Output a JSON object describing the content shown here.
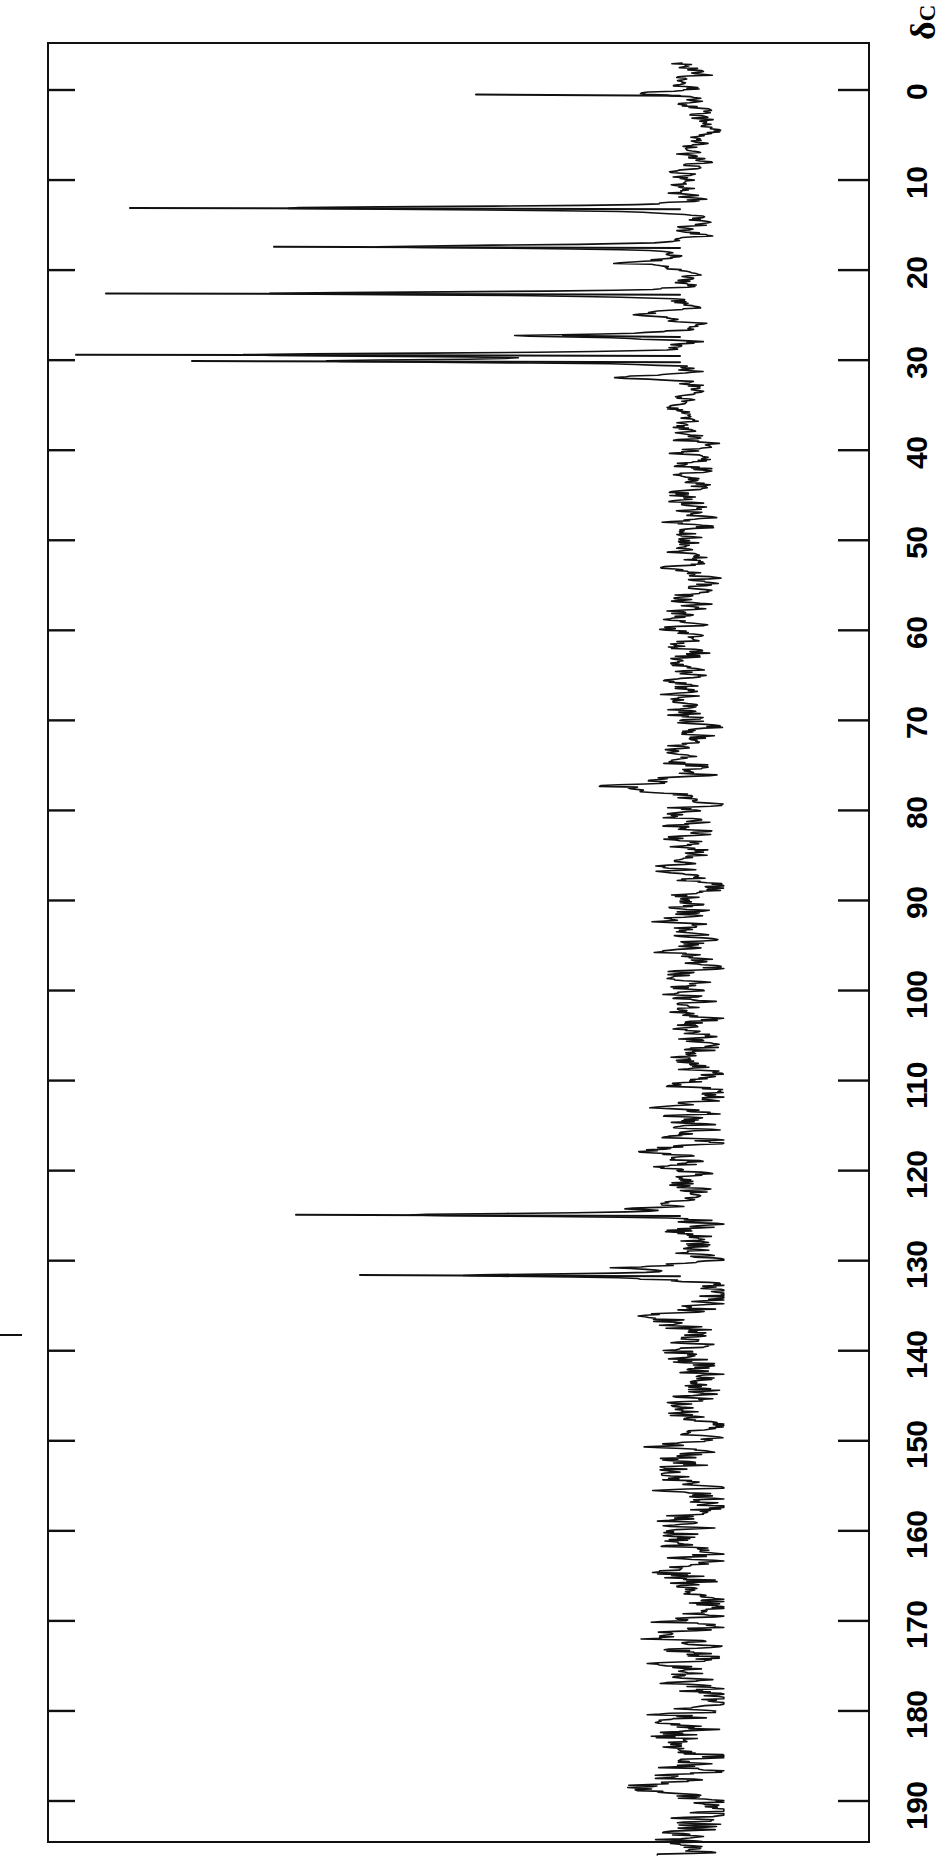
{
  "figure": {
    "kind": "nmr-spectrum",
    "nucleus_label": "δ",
    "nucleus_subscript": "C",
    "orientation": "rotated-90-clockwise",
    "background_color": "#ffffff",
    "trace_color": "#111111",
    "axis_color": "#111111"
  },
  "axis": {
    "label": "δ",
    "label_subscript": "C",
    "unit": "ppm",
    "direction": "increasing-downward",
    "min": -3,
    "max": 196,
    "tick_step": 10,
    "ticks": [
      {
        "value": 0,
        "label": "0"
      },
      {
        "value": 10,
        "label": "10"
      },
      {
        "value": 20,
        "label": "20"
      },
      {
        "value": 30,
        "label": "30"
      },
      {
        "value": 40,
        "label": "40"
      },
      {
        "value": 50,
        "label": "50"
      },
      {
        "value": 60,
        "label": "60"
      },
      {
        "value": 70,
        "label": "70"
      },
      {
        "value": 80,
        "label": "80"
      },
      {
        "value": 90,
        "label": "90"
      },
      {
        "value": 100,
        "label": "100"
      },
      {
        "value": 110,
        "label": "110"
      },
      {
        "value": 120,
        "label": "120"
      },
      {
        "value": 130,
        "label": "130"
      },
      {
        "value": 140,
        "label": "140"
      },
      {
        "value": 150,
        "label": "150"
      },
      {
        "value": 160,
        "label": "160"
      },
      {
        "value": 170,
        "label": "170"
      },
      {
        "value": 180,
        "label": "180"
      },
      {
        "value": 190,
        "label": "190"
      }
    ]
  },
  "chart_data": {
    "type": "line",
    "title": "",
    "subtitle": "",
    "xlabel": "",
    "ylabel": "",
    "xlim": [
      -3,
      196
    ],
    "ylim": [
      0,
      1
    ],
    "grid": false,
    "legend": "none",
    "x_axis_name": "chemical shift (ppm)",
    "y_axis_name": "intensity (arbitrary units)",
    "baseline_intensity": 0.0,
    "noise_amplitude": 0.035,
    "peaks": [
      {
        "shift": 0.4,
        "intensity": 0.1,
        "label": "TMS"
      },
      {
        "shift": 13.1,
        "intensity": 0.68,
        "label": ""
      },
      {
        "shift": 17.4,
        "intensity": 0.5,
        "label": ""
      },
      {
        "shift": 19.2,
        "intensity": 0.11,
        "label": ""
      },
      {
        "shift": 22.6,
        "intensity": 0.69,
        "label": ""
      },
      {
        "shift": 25.0,
        "intensity": 0.08,
        "label": ""
      },
      {
        "shift": 27.3,
        "intensity": 0.25,
        "label": ""
      },
      {
        "shift": 29.4,
        "intensity": 0.74,
        "label": ""
      },
      {
        "shift": 30.1,
        "intensity": 0.6,
        "label": ""
      },
      {
        "shift": 31.9,
        "intensity": 0.12,
        "label": ""
      },
      {
        "shift": 76.7,
        "intensity": 0.06,
        "label": "CDCl3"
      },
      {
        "shift": 77.2,
        "intensity": 0.07,
        "label": "CDCl3"
      },
      {
        "shift": 77.7,
        "intensity": 0.06,
        "label": "CDCl3"
      },
      {
        "shift": 124.2,
        "intensity": 0.09,
        "label": ""
      },
      {
        "shift": 124.9,
        "intensity": 0.47,
        "label": ""
      },
      {
        "shift": 130.9,
        "intensity": 0.1,
        "label": ""
      },
      {
        "shift": 131.6,
        "intensity": 0.38,
        "label": ""
      }
    ]
  },
  "margin_mark": {
    "present": true,
    "description": "short horizontal rule in the left page margin"
  }
}
